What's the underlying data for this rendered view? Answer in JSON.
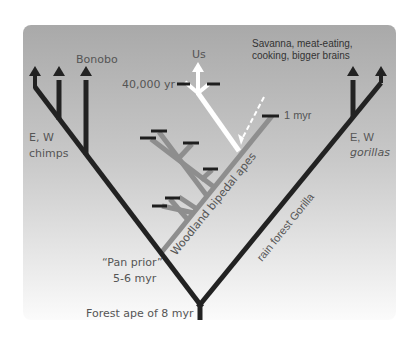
{
  "diagram": {
    "type": "phylogenetic-tree",
    "colors": {
      "background_top": "#a9a9a9",
      "background_bottom": "#fbfbfb",
      "ape_lineage": "#222222",
      "bipedal_lineage": "#8e8e8e",
      "human_lineage": "#ffffff",
      "tick": "#1e1e1e",
      "label": "#555555"
    },
    "labels": {
      "bonobo": "Bonobo",
      "us": "Us",
      "us_date": "40,000 yr",
      "savanna_line1": "Savanna, meat-eating,",
      "savanna_line2": "cooking, bigger brains",
      "one_myr": "1 myr",
      "chimps_line1": "E, W",
      "chimps_line2": "chimps",
      "gorillas_line1": "E, W",
      "gorillas_line2": "gorillas",
      "woodland": "Woodland bipedal apes",
      "rainforest": "rain forest Gorilla",
      "pan_prior_line1": "“Pan prior”",
      "pan_prior_line2": "5-6 myr",
      "root": "Forest ape of 8 myr"
    },
    "nodes": [
      {
        "name": "Forest ape",
        "age": "8 myr",
        "role": "root"
      },
      {
        "name": "Pan prior",
        "age": "5-6 myr",
        "role": "chimp/human split"
      },
      {
        "name": "E, W chimps",
        "role": "leaf (2 arrows)"
      },
      {
        "name": "Bonobo",
        "role": "leaf"
      },
      {
        "name": "E, W gorillas",
        "role": "leaf (2 arrows)"
      },
      {
        "name": "Woodland bipedal apes",
        "role": "extinct side branches (7 ticks)"
      },
      {
        "name": "Us",
        "age": "40,000 yr",
        "role": "leaf"
      }
    ]
  }
}
